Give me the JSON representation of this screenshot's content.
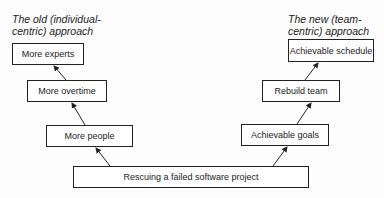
{
  "diagram": {
    "left_title_line1": "The old (individual-",
    "left_title_line2": "centric) approach",
    "right_title_line1": "The new (team-",
    "right_title_line2": "centric) approach",
    "root": "Rescuing a failed software project",
    "left_chain": [
      "More people",
      "More overtime",
      "More experts"
    ],
    "right_chain": [
      "Achievable goals",
      "Rebuild team",
      "Achievable schedule"
    ]
  }
}
